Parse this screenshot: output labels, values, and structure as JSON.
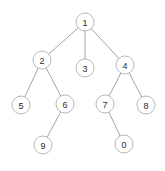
{
  "figure": {
    "kind": "tree-diagram",
    "title": "",
    "width": 165,
    "height": 171,
    "background_color": "#ffffff",
    "node_fill_color": "#ffffff",
    "node_stroke_color": "#b0b0b0",
    "edge_color": "#9a9a9a",
    "label_color": "#2b2b2b",
    "node_radius": 9
  },
  "nodes": [
    {
      "id": "n1",
      "label": "1",
      "x": 85,
      "y": 22,
      "level": 0
    },
    {
      "id": "n2",
      "label": "2",
      "x": 42,
      "y": 60,
      "level": 1
    },
    {
      "id": "n3",
      "label": "3",
      "x": 85,
      "y": 68,
      "level": 1
    },
    {
      "id": "n4",
      "label": "4",
      "x": 125,
      "y": 65,
      "level": 1
    },
    {
      "id": "n5",
      "label": "5",
      "x": 21,
      "y": 105,
      "level": 2
    },
    {
      "id": "n6",
      "label": "6",
      "x": 65,
      "y": 104,
      "level": 2
    },
    {
      "id": "n7",
      "label": "7",
      "x": 105,
      "y": 104,
      "level": 2
    },
    {
      "id": "n8",
      "label": "8",
      "x": 146,
      "y": 105,
      "level": 2
    },
    {
      "id": "n9",
      "label": "9",
      "x": 43,
      "y": 145,
      "level": 3
    },
    {
      "id": "n0",
      "label": "0",
      "x": 124,
      "y": 144,
      "level": 3
    }
  ],
  "edges": [
    {
      "from": "n1",
      "to": "n2"
    },
    {
      "from": "n1",
      "to": "n3"
    },
    {
      "from": "n1",
      "to": "n4"
    },
    {
      "from": "n2",
      "to": "n5"
    },
    {
      "from": "n2",
      "to": "n6"
    },
    {
      "from": "n6",
      "to": "n9"
    },
    {
      "from": "n4",
      "to": "n7"
    },
    {
      "from": "n4",
      "to": "n8"
    },
    {
      "from": "n7",
      "to": "n0"
    }
  ]
}
